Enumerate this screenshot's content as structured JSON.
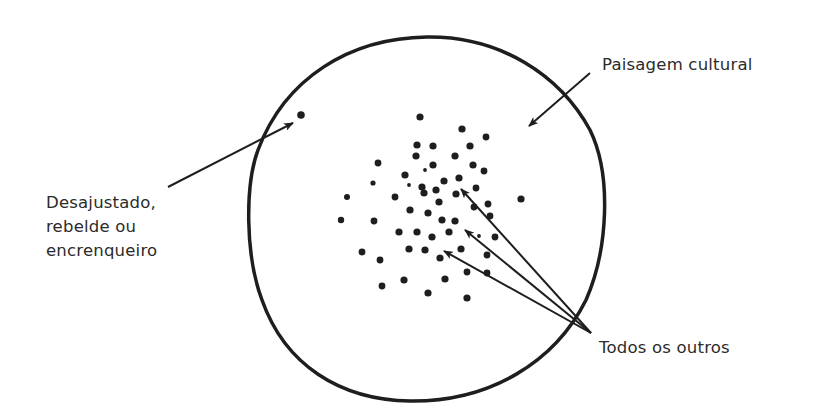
{
  "diagram": {
    "type": "conceptual-scatter",
    "colors": {
      "background": "#ffffff",
      "stroke": "#1e1e1e",
      "text": "#2b2b2b"
    },
    "labels": {
      "landscape": "Paisagem cultural",
      "misfit": [
        "Desajustado,",
        "rebelde ou",
        "encrenqueiro"
      ],
      "others": "Todos os outros"
    },
    "boundary": {
      "name": "cultural-landscape-boundary",
      "path": "M 427 37 C 500 36 560 75 590 130 C 612 175 608 250 586 300 C 555 362 490 402 410 401 C 340 400 285 365 262 300 C 245 255 245 185 258 150 C 285 78 350 38 427 37 Z",
      "stroke_width": 3.5
    },
    "misfit_dot": {
      "x": 301,
      "y": 115,
      "r": 3.8
    },
    "dots": [
      {
        "x": 420,
        "y": 117,
        "r": 3.6
      },
      {
        "x": 462,
        "y": 129,
        "r": 3.6
      },
      {
        "x": 486,
        "y": 137,
        "r": 3.4
      },
      {
        "x": 417,
        "y": 145,
        "r": 3.6
      },
      {
        "x": 433,
        "y": 146,
        "r": 3.6
      },
      {
        "x": 470,
        "y": 146,
        "r": 3.6
      },
      {
        "x": 416,
        "y": 156,
        "r": 3.6
      },
      {
        "x": 455,
        "y": 156,
        "r": 3.6
      },
      {
        "x": 378,
        "y": 163,
        "r": 3.4
      },
      {
        "x": 433,
        "y": 165,
        "r": 3.6
      },
      {
        "x": 473,
        "y": 165,
        "r": 3.6
      },
      {
        "x": 484,
        "y": 171,
        "r": 3.4
      },
      {
        "x": 425,
        "y": 170,
        "r": 1.9
      },
      {
        "x": 405,
        "y": 175,
        "r": 3.6
      },
      {
        "x": 444,
        "y": 181,
        "r": 3.6
      },
      {
        "x": 459,
        "y": 178,
        "r": 3.6
      },
      {
        "x": 373,
        "y": 183,
        "r": 2.6
      },
      {
        "x": 409,
        "y": 185,
        "r": 1.9
      },
      {
        "x": 422,
        "y": 187,
        "r": 3.6
      },
      {
        "x": 424,
        "y": 193,
        "r": 3.6
      },
      {
        "x": 436,
        "y": 190,
        "r": 3.6
      },
      {
        "x": 456,
        "y": 194,
        "r": 3.6
      },
      {
        "x": 476,
        "y": 188,
        "r": 3.4
      },
      {
        "x": 347,
        "y": 197,
        "r": 3.0
      },
      {
        "x": 395,
        "y": 197,
        "r": 3.4
      },
      {
        "x": 521,
        "y": 199,
        "r": 3.6
      },
      {
        "x": 439,
        "y": 202,
        "r": 3.6
      },
      {
        "x": 488,
        "y": 204,
        "r": 3.4
      },
      {
        "x": 474,
        "y": 207,
        "r": 3.4
      },
      {
        "x": 490,
        "y": 216,
        "r": 3.4
      },
      {
        "x": 410,
        "y": 210,
        "r": 3.6
      },
      {
        "x": 428,
        "y": 213,
        "r": 3.6
      },
      {
        "x": 341,
        "y": 220,
        "r": 3.2
      },
      {
        "x": 374,
        "y": 221,
        "r": 3.4
      },
      {
        "x": 442,
        "y": 220,
        "r": 3.6
      },
      {
        "x": 455,
        "y": 221,
        "r": 3.6
      },
      {
        "x": 399,
        "y": 232,
        "r": 3.6
      },
      {
        "x": 417,
        "y": 232,
        "r": 3.6
      },
      {
        "x": 449,
        "y": 232,
        "r": 3.6
      },
      {
        "x": 432,
        "y": 237,
        "r": 3.6
      },
      {
        "x": 479,
        "y": 236,
        "r": 1.9
      },
      {
        "x": 495,
        "y": 237,
        "r": 3.4
      },
      {
        "x": 409,
        "y": 249,
        "r": 3.6
      },
      {
        "x": 425,
        "y": 250,
        "r": 3.6
      },
      {
        "x": 461,
        "y": 249,
        "r": 3.6
      },
      {
        "x": 362,
        "y": 252,
        "r": 3.4
      },
      {
        "x": 440,
        "y": 258,
        "r": 3.6
      },
      {
        "x": 487,
        "y": 255,
        "r": 3.4
      },
      {
        "x": 380,
        "y": 260,
        "r": 3.4
      },
      {
        "x": 467,
        "y": 272,
        "r": 3.4
      },
      {
        "x": 487,
        "y": 273,
        "r": 3.4
      },
      {
        "x": 404,
        "y": 280,
        "r": 3.6
      },
      {
        "x": 445,
        "y": 279,
        "r": 3.6
      },
      {
        "x": 382,
        "y": 286,
        "r": 3.4
      },
      {
        "x": 428,
        "y": 293,
        "r": 3.6
      },
      {
        "x": 467,
        "y": 298,
        "r": 3.6
      }
    ],
    "arrows": [
      {
        "name": "landscape-arrow",
        "x1": 590,
        "y1": 73,
        "x2": 529,
        "y2": 126
      },
      {
        "name": "misfit-arrow",
        "x1": 168,
        "y1": 187,
        "x2": 293,
        "y2": 123
      },
      {
        "name": "others-arrow-1",
        "x1": 591,
        "y1": 333,
        "x2": 461,
        "y2": 189
      },
      {
        "name": "others-arrow-2",
        "x1": 591,
        "y1": 333,
        "x2": 465,
        "y2": 230
      },
      {
        "name": "others-arrow-3",
        "x1": 591,
        "y1": 333,
        "x2": 444,
        "y2": 251
      }
    ]
  }
}
